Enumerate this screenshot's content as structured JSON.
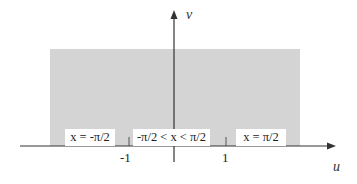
{
  "diagram": {
    "axes": {
      "horizontal_label": "u",
      "vertical_label": "v"
    },
    "ticks": [
      {
        "label": "-1",
        "value": -1
      },
      {
        "label": "1",
        "value": 1
      }
    ],
    "region": {
      "description": "shaded strip region above u-axis",
      "fill_color": "#d4d4d4"
    },
    "boundary_labels": [
      {
        "id": "left",
        "text": "x = -π/2"
      },
      {
        "id": "middle",
        "text": "-π/2 < x < π/2"
      },
      {
        "id": "right",
        "text": "x = π/2"
      }
    ],
    "colors": {
      "axis": "#333333",
      "shade": "#d4d4d4",
      "label_bg": "#ffffff"
    }
  }
}
